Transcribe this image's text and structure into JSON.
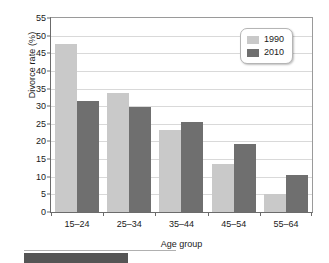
{
  "chart_data": {
    "type": "bar",
    "title": "",
    "xlabel": "Age group",
    "ylabel": "Divorce rate (%)",
    "categories": [
      "15–24",
      "25–34",
      "35–44",
      "45–54",
      "55–64"
    ],
    "series": [
      {
        "name": "1990",
        "color": "#c9c9c9",
        "values": [
          47.5,
          33.7,
          23.2,
          13.5,
          5.0
        ]
      },
      {
        "name": "2010",
        "color": "#6f6f6f",
        "values": [
          31.5,
          29.8,
          25.6,
          19.3,
          10.5
        ]
      }
    ],
    "ylim": [
      0,
      55
    ],
    "ytick_values": [
      0,
      5,
      10,
      15,
      20,
      25,
      30,
      35,
      40,
      45,
      50,
      55
    ],
    "ytick_labels": [
      "0",
      "5",
      "10",
      "15",
      "20",
      "25",
      "30",
      "35",
      "40",
      "45",
      "50",
      "55"
    ],
    "grid": "horizontal",
    "legend_position": "top-right",
    "legend_entries": [
      "1990",
      "2010"
    ]
  },
  "axes": {
    "y_title": "Divorce rate (%)",
    "x_title": "Age group"
  },
  "legend": {
    "entries": [
      {
        "label": "1990"
      },
      {
        "label": "2010"
      }
    ]
  },
  "colors": {
    "series_1990": "#c9c9c9",
    "series_2010": "#6f6f6f",
    "gridline": "#d9d9d9",
    "axis": "#6b6b6b",
    "text": "#1a1a1a"
  }
}
